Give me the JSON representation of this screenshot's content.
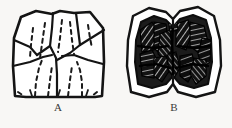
{
  "figure": {
    "kind": "line-drawing-plate",
    "background_color": "#f8f7f5",
    "ink_color": "#1a1a1a",
    "panels": [
      {
        "id": "A",
        "caption": "A",
        "name": "outline-drawing",
        "style": "unshaded outline with solid cusp-boundary lines and dashed fissure lines",
        "solid_outline": true,
        "dashed_lines": 8,
        "solid_internal_lines": 7,
        "fill": "none"
      },
      {
        "id": "B",
        "caption": "B",
        "name": "shaded-drawing",
        "style": "heavily inked, cross-hatched and stippled wear facets inside a double outline",
        "solid_outline": true,
        "fill": "dense black hatching",
        "facets": 12
      }
    ]
  },
  "labels": {
    "panel_a": "A",
    "panel_b": "B"
  },
  "colors": {
    "paper": "#f8f7f5",
    "ink": "#1a1a1a",
    "caption": "#3a3a3a"
  }
}
